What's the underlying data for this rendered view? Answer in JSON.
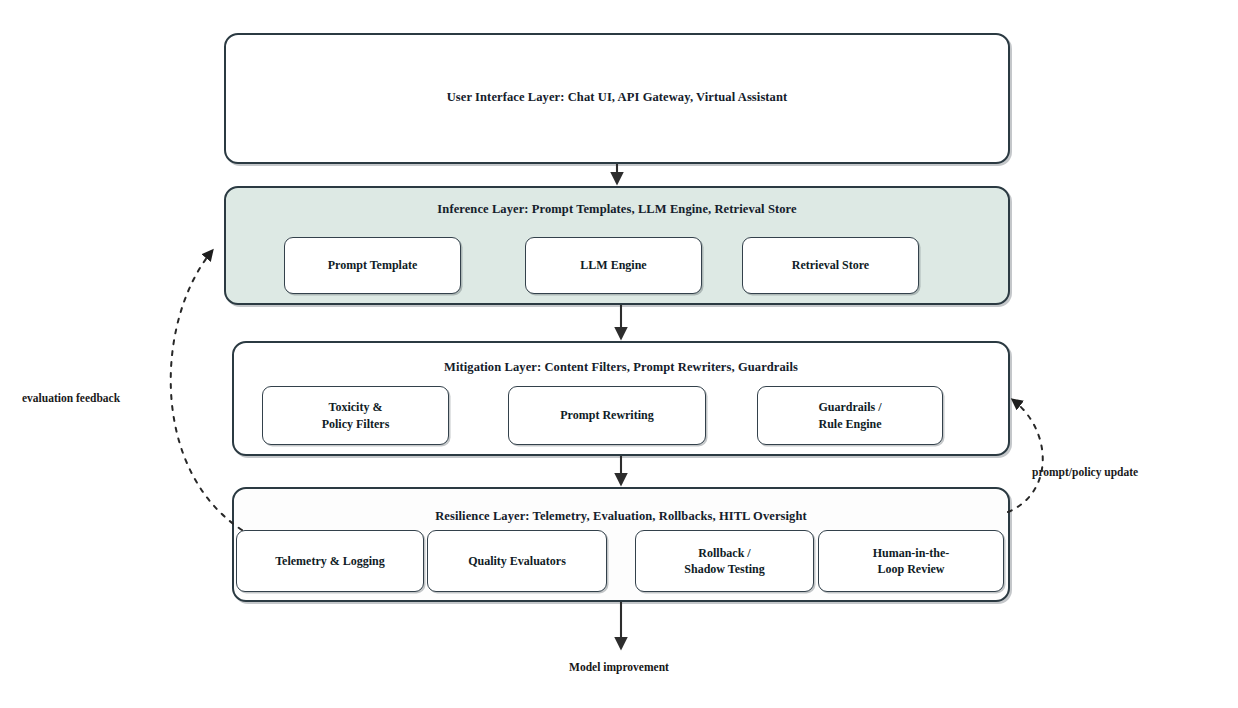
{
  "diagram": {
    "colors": {
      "stroke": "#2b3a42",
      "tint": "#dde9e4",
      "text": "#101c26",
      "arrow": "#2d2d2d"
    },
    "layers": [
      {
        "id": "user-interface",
        "title": "User Interface Layer: Chat UI, API Gateway, Virtual Assistant",
        "fill": "plain",
        "items": []
      },
      {
        "id": "inference",
        "title": "Inference Layer: Prompt Templates, LLM Engine, Retrieval Store",
        "fill": "tinted",
        "items": [
          {
            "label": "Prompt Template"
          },
          {
            "label": "LLM Engine"
          },
          {
            "label": "Retrieval Store"
          }
        ]
      },
      {
        "id": "mitigation",
        "title": "Mitigation Layer: Content Filters, Prompt Rewriters, Guardrails",
        "fill": "plain",
        "items": [
          {
            "label": "Toxicity &\nPolicy Filters"
          },
          {
            "label": "Prompt Rewriting"
          },
          {
            "label": "Guardrails /\nRule Engine"
          }
        ]
      },
      {
        "id": "resilience",
        "title": "Resilience Layer: Telemetry, Evaluation, Rollbacks, HITL Oversight",
        "fill": "faint",
        "items": [
          {
            "label": "Telemetry & Logging"
          },
          {
            "label": "Quality Evaluators"
          },
          {
            "label": "Rollback /\nShadow Testing"
          },
          {
            "label": "Human-in-the-\nLoop Review"
          }
        ]
      }
    ],
    "feedback_edges": [
      {
        "id": "evaluation-feedback",
        "label": "evaluation feedback",
        "from": "resilience",
        "to": "inference",
        "side": "left",
        "style": "dashed"
      },
      {
        "id": "prompt-policy-update",
        "label": "prompt/policy update",
        "from": "resilience",
        "to": "mitigation",
        "side": "right",
        "style": "dashed"
      }
    ],
    "output_label": "Model improvement"
  }
}
